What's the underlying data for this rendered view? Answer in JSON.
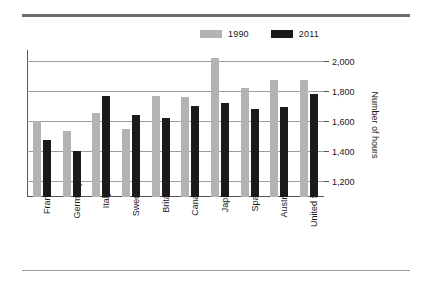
{
  "legend": {
    "items": [
      {
        "label": "1990",
        "color": "#b3b3b3",
        "icon": "legend-swatch-icon"
      },
      {
        "label": "2011",
        "color": "#1a1a1a",
        "icon": "legend-swatch-icon"
      }
    ]
  },
  "axis": {
    "y_title": "Number of hours",
    "y_ticks": [
      "2,000",
      "1,800",
      "1,600",
      "1,400",
      "1,200"
    ]
  },
  "chart_data": {
    "type": "bar",
    "title": "",
    "subtitle": "",
    "xlabel": "",
    "ylabel": "Number of hours",
    "ylim": [
      1100,
      2080
    ],
    "yticks": [
      1200,
      1400,
      1600,
      1800,
      2000
    ],
    "grid": true,
    "legend_position": "top-right",
    "y_axis_side": "right",
    "categories": [
      "France",
      "Germany",
      "Italy",
      "Sweden",
      "Britain",
      "Canada",
      "Japan",
      "Spain",
      "Australia",
      "United States"
    ],
    "series": [
      {
        "name": "1990",
        "color": "#b3b3b3",
        "values": [
          1605,
          1540,
          1660,
          1555,
          1775,
          1770,
          2030,
          1830,
          1880,
          1880
        ]
      },
      {
        "name": "2011",
        "color": "#1a1a1a",
        "values": [
          1480,
          1410,
          1775,
          1645,
          1625,
          1705,
          1725,
          1690,
          1700,
          1785
        ]
      }
    ]
  }
}
